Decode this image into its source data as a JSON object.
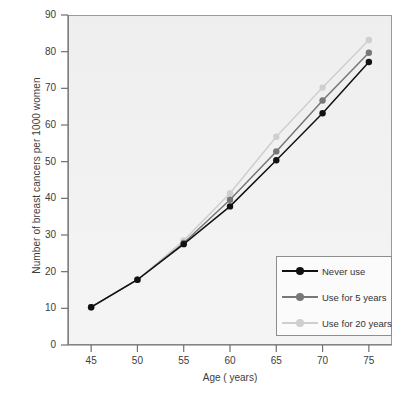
{
  "chart_data": {
    "type": "line",
    "title": "",
    "xlabel": "Age ( years)",
    "ylabel": "Number of breast cancers per 1000 women",
    "x": [
      45,
      50,
      55,
      60,
      65,
      70,
      75
    ],
    "xlim": [
      42.5,
      77.5
    ],
    "ylim": [
      0,
      90
    ],
    "xticks": [
      "45",
      "50",
      "55",
      "60",
      "65",
      "70",
      "75"
    ],
    "yticks": [
      "0",
      "10",
      "20",
      "30",
      "40",
      "50",
      "60",
      "70",
      "80",
      "90"
    ],
    "grid": false,
    "legend_position": "lower-right",
    "series": [
      {
        "name": "Never use",
        "color": "#111111",
        "values": [
          10.3,
          17.8,
          27.5,
          37.8,
          50.4,
          63.2,
          77.2
        ]
      },
      {
        "name": "Use for 5 years",
        "color": "#777777",
        "values": [
          10.3,
          17.8,
          27.8,
          39.6,
          52.8,
          66.7,
          79.7
        ]
      },
      {
        "name": "Use for 20 years",
        "color": "#cfcfcf",
        "values": [
          10.3,
          17.8,
          28.5,
          41.4,
          56.8,
          70.2,
          83.2
        ]
      }
    ]
  },
  "axes": {
    "y_title": "Number of breast cancers per 1000 women",
    "x_title": "Age ( years)",
    "y_tick_labels": [
      "90",
      "80",
      "70",
      "60",
      "50",
      "40",
      "30",
      "20",
      "10",
      "0"
    ],
    "x_tick_labels": [
      "45",
      "50",
      "55",
      "60",
      "65",
      "70",
      "75"
    ]
  },
  "legend": {
    "items": [
      {
        "label": "Never use",
        "color": "#111111"
      },
      {
        "label": "Use for 5 years",
        "color": "#777777"
      },
      {
        "label": "Use for 20 years",
        "color": "#cfcfcf"
      }
    ]
  },
  "colors": {
    "plot_background": "#ebebeb",
    "axis": "#6f6f6f",
    "text": "#3c3c3c",
    "legend_border": "#8e8e8e"
  }
}
